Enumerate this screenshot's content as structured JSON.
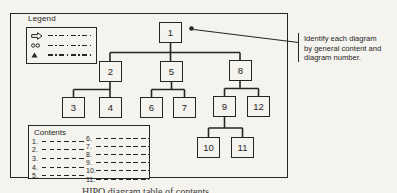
{
  "diagram": {
    "colors": {
      "paper": "#f5f3ee",
      "ink": "#262626"
    },
    "legend": {
      "title": "Legend",
      "items": [
        {
          "icon": "open-arrow-icon"
        },
        {
          "icon": "double-circle-icon"
        },
        {
          "icon": "triangle-icon"
        }
      ]
    },
    "contents": {
      "title": "Contents",
      "left_items": [
        "1.",
        "2.",
        "3.",
        "4.",
        "5."
      ],
      "right_items": [
        "6.",
        "7.",
        "8.",
        "9.",
        "10.",
        "11."
      ]
    },
    "tree": {
      "nodes": [
        {
          "id": "1",
          "label": "1"
        },
        {
          "id": "2",
          "label": "2"
        },
        {
          "id": "5",
          "label": "5"
        },
        {
          "id": "8",
          "label": "8"
        },
        {
          "id": "3",
          "label": "3"
        },
        {
          "id": "4",
          "label": "4"
        },
        {
          "id": "6",
          "label": "6"
        },
        {
          "id": "7",
          "label": "7"
        },
        {
          "id": "9",
          "label": "9"
        },
        {
          "id": "12",
          "label": "12"
        },
        {
          "id": "10",
          "label": "10"
        },
        {
          "id": "11",
          "label": "11"
        }
      ],
      "edges": [
        [
          "1",
          "2"
        ],
        [
          "1",
          "5"
        ],
        [
          "1",
          "8"
        ],
        [
          "2",
          "3"
        ],
        [
          "2",
          "4"
        ],
        [
          "5",
          "6"
        ],
        [
          "5",
          "7"
        ],
        [
          "8",
          "9"
        ],
        [
          "8",
          "12"
        ],
        [
          "9",
          "10"
        ],
        [
          "9",
          "11"
        ]
      ]
    },
    "annotation": {
      "lines": [
        "Identify each diagram",
        "by general content and",
        "diagram number."
      ]
    },
    "caption": "HIPO diagram table of contents"
  }
}
